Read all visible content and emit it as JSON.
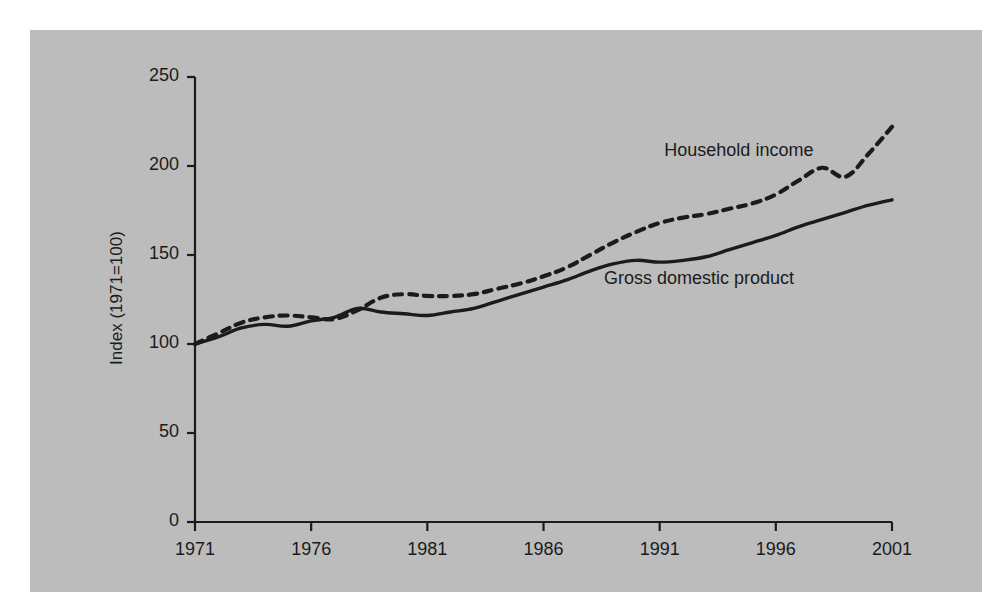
{
  "figure": {
    "panel_color": "#bcbcbc",
    "page_color": "#ffffff",
    "ink_color": "#1b1b1b"
  },
  "chart_data": {
    "type": "line",
    "title": "",
    "subtitle": "",
    "xlabel": "",
    "ylabel": "Index (1971=100)",
    "xlim": [
      1971,
      2001
    ],
    "ylim": [
      0,
      250
    ],
    "grid": false,
    "legend_position": "inline-annotations",
    "xticks": [
      1971,
      1976,
      1981,
      1986,
      1991,
      1996,
      2001
    ],
    "xtick_labels": [
      "1971",
      "1976",
      "1981",
      "1986",
      "1991",
      "1996",
      "2001"
    ],
    "yticks": [
      0,
      50,
      100,
      150,
      200,
      250
    ],
    "ytick_labels": [
      "0",
      "50",
      "100",
      "150",
      "200",
      "250"
    ],
    "x": [
      1971,
      1972,
      1973,
      1974,
      1975,
      1976,
      1977,
      1978,
      1979,
      1980,
      1981,
      1982,
      1983,
      1984,
      1985,
      1986,
      1987,
      1988,
      1989,
      1990,
      1991,
      1992,
      1993,
      1994,
      1995,
      1996,
      1997,
      1998,
      1999,
      2000,
      2001
    ],
    "series": [
      {
        "name": "Gross domestic product",
        "style": "solid",
        "color": "#1b1b1b",
        "annotation": "Gross domestic product",
        "values": [
          100,
          104,
          109,
          111,
          110,
          113,
          115,
          120,
          118,
          117,
          116,
          118,
          120,
          124,
          128,
          132,
          136,
          141,
          145,
          147,
          146,
          147,
          149,
          153,
          157,
          161,
          166,
          170,
          174,
          178,
          181
        ]
      },
      {
        "name": "Household income",
        "style": "dashed",
        "color": "#1b1b1b",
        "annotation": "Household income",
        "values": [
          100,
          106,
          112,
          115,
          116,
          115,
          114,
          119,
          126,
          128,
          127,
          127,
          128,
          131,
          134,
          138,
          143,
          150,
          157,
          163,
          168,
          171,
          173,
          176,
          179,
          184,
          192,
          199,
          194,
          207,
          222
        ]
      }
    ],
    "annotations": [
      {
        "text": "Household income",
        "x": 1991.2,
        "y": 208
      },
      {
        "text": "Gross domestic product",
        "x": 1988.6,
        "y": 136
      }
    ]
  }
}
